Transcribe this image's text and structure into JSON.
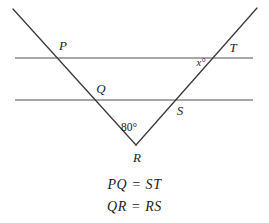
{
  "figure": {
    "title_text": "",
    "colors": {
      "background": "#ffffff",
      "transversal_stroke": "#3a3a3a",
      "parallel_line_stroke": "#8a8a8a",
      "label_text": "#1c1c1c"
    },
    "parallel_lines": [
      {
        "name": "upper-parallel-line",
        "x1": 15,
        "y1": 58,
        "x2": 253,
        "y2": 58
      },
      {
        "name": "lower-parallel-line",
        "x1": 15,
        "y1": 100,
        "x2": 253,
        "y2": 100
      }
    ],
    "rays": [
      {
        "name": "left-ray-PR",
        "x1": 13,
        "y1": 9,
        "x2": 136,
        "y2": 145
      },
      {
        "name": "right-ray-RT",
        "x1": 136,
        "y1": 145,
        "x2": 257,
        "y2": 8
      }
    ],
    "points": [
      {
        "id": "P",
        "label": "P",
        "px": 57,
        "py": 58,
        "label_x": 63,
        "label_y": 45
      },
      {
        "id": "Q",
        "label": "Q",
        "px": 95,
        "py": 100,
        "label_x": 101,
        "label_y": 88
      },
      {
        "id": "R",
        "label": "R",
        "px": 136,
        "py": 145,
        "label_x": 137,
        "label_y": 157
      },
      {
        "id": "S",
        "label": "S",
        "px": 173,
        "py": 100,
        "label_x": 180,
        "label_y": 110
      },
      {
        "id": "T",
        "label": "T",
        "px": 213,
        "py": 58,
        "label_x": 233,
        "label_y": 47
      }
    ],
    "angles": [
      {
        "id": "angle-R",
        "label": "80°",
        "value": 80,
        "unit": "degrees",
        "label_x": 129,
        "label_y": 128
      },
      {
        "id": "angle-x",
        "label": "x°",
        "value": "x",
        "unit": "degrees",
        "label_x": 201,
        "label_y": 63
      }
    ],
    "captions": [
      {
        "id": "caption-pq-st",
        "text": "PQ = ST"
      },
      {
        "id": "caption-qr-rs",
        "text": "QR = RS"
      }
    ]
  }
}
